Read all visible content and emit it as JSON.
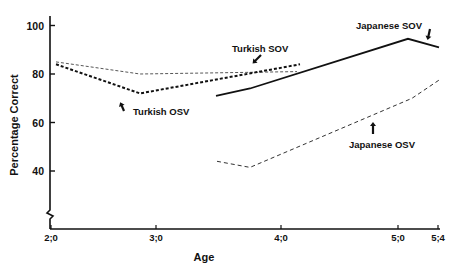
{
  "chart_data": {
    "type": "line",
    "title": "",
    "xlabel": "Age",
    "ylabel": "Percentage Correct",
    "ylim": [
      20,
      100
    ],
    "y_ticks": [
      40,
      60,
      80,
      100
    ],
    "x_ticks": [
      {
        "label": "2;0",
        "px": 51
      },
      {
        "label": "3;0",
        "px": 156
      },
      {
        "label": "4;0",
        "px": 281
      },
      {
        "label": "5;0",
        "px": 398
      },
      {
        "label": "5;4",
        "px": 438
      }
    ],
    "grid": false,
    "legend": "inline annotations with arrows",
    "series": [
      {
        "name": "Turkish SOV",
        "style": "dashed-thin",
        "points": [
          {
            "age": "2;0",
            "px": 56,
            "value": 85
          },
          {
            "age": "2;10",
            "px": 140,
            "value": 80
          },
          {
            "age": "4;0",
            "px": 297,
            "value": 81
          }
        ]
      },
      {
        "name": "Turkish OSV",
        "style": "dashed-bold",
        "points": [
          {
            "age": "2;0",
            "px": 56,
            "value": 84
          },
          {
            "age": "2;10",
            "px": 140,
            "value": 72
          },
          {
            "age": "4;1",
            "px": 300,
            "value": 84
          }
        ]
      },
      {
        "name": "Japanese SOV",
        "style": "solid",
        "points": [
          {
            "age": "3;5",
            "px": 216,
            "value": 71
          },
          {
            "age": "3;9",
            "px": 250,
            "value": 74
          },
          {
            "age": "5;1",
            "px": 408,
            "value": 94.5
          },
          {
            "age": "5;4",
            "px": 439,
            "value": 91
          }
        ]
      },
      {
        "name": "Japanese OSV",
        "style": "dashed-medium",
        "points": [
          {
            "age": "3;5",
            "px": 217,
            "value": 44
          },
          {
            "age": "3;9",
            "px": 250,
            "value": 41.5
          },
          {
            "age": "5;1",
            "px": 412,
            "value": 70
          },
          {
            "age": "5;4",
            "px": 439,
            "value": 77.5
          }
        ]
      }
    ],
    "annotations": [
      {
        "text": "Turkish SOV",
        "x": 232,
        "y": 52
      },
      {
        "text": "Turkish OSV",
        "x": 133,
        "y": 115
      },
      {
        "text": "Japanese SOV",
        "x": 356,
        "y": 29
      },
      {
        "text": "Japanese OSV",
        "x": 349,
        "y": 148
      }
    ]
  }
}
